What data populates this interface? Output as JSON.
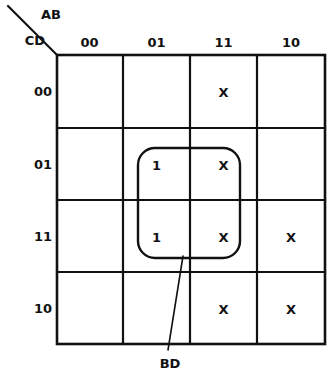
{
  "diagram": {
    "type": "karnaugh-map",
    "variables_top": "AB",
    "variables_left": "CD",
    "column_headers": [
      "00",
      "01",
      "11",
      "10"
    ],
    "row_headers": [
      "00",
      "01",
      "11",
      "10"
    ],
    "cells": [
      {
        "row": "00",
        "values": [
          "",
          "",
          "X",
          ""
        ]
      },
      {
        "row": "01",
        "values": [
          "",
          "1",
          "X",
          ""
        ]
      },
      {
        "row": "11",
        "values": [
          "",
          "1",
          "X",
          "X"
        ]
      },
      {
        "row": "10",
        "values": [
          "",
          "",
          "X",
          "X"
        ]
      }
    ],
    "groups": [
      {
        "label": "BD",
        "columns": [
          "01",
          "11"
        ],
        "rows": [
          "01",
          "11"
        ]
      }
    ],
    "colors": {
      "ink": "#111111",
      "background": "#ffffff"
    }
  }
}
